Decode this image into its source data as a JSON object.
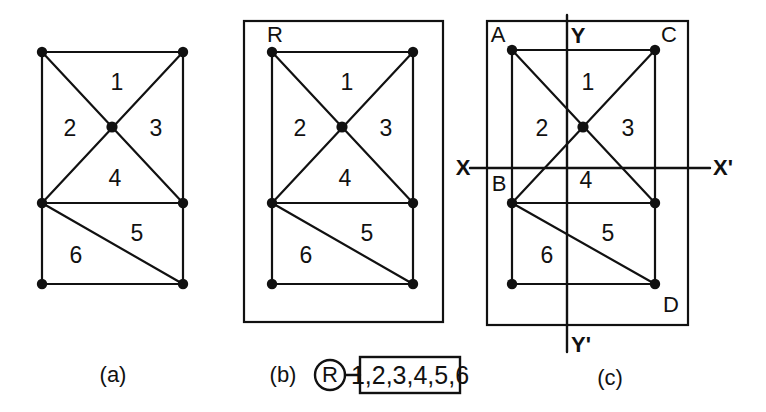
{
  "figure": {
    "kind": "graph-planarity-diagram",
    "panels": [
      {
        "id": "a",
        "caption": "(a)",
        "has_outer_boundary": false,
        "region_labels": [
          "1",
          "2",
          "3",
          "4",
          "5",
          "6"
        ],
        "vertex_labels": []
      },
      {
        "id": "b",
        "caption": "(b)",
        "has_outer_boundary": true,
        "outer_region_label": "R",
        "region_labels": [
          "1",
          "2",
          "3",
          "4",
          "5",
          "6"
        ],
        "vertex_labels": []
      },
      {
        "id": "c",
        "caption": "(c)",
        "has_outer_boundary": true,
        "region_labels": [
          "1",
          "2",
          "3",
          "4",
          "5",
          "6"
        ],
        "vertex_labels": [
          "A",
          "B",
          "C",
          "D"
        ],
        "axes": {
          "horizontal_left": "X",
          "horizontal_right": "X'",
          "vertical_top": "Y",
          "vertical_bottom": "Y'"
        }
      }
    ],
    "region_map": {
      "node_label": "R",
      "box_label": "1,2,3,4,5,6"
    },
    "colors": {
      "stroke": "#111111",
      "text": "#111111",
      "background": "#ffffff"
    }
  },
  "panel_a": {
    "region_1": "1",
    "region_2": "2",
    "region_3": "3",
    "region_4": "4",
    "region_5": "5",
    "region_6": "6",
    "caption": "(a)"
  },
  "panel_b": {
    "outer_label": "R",
    "region_1": "1",
    "region_2": "2",
    "region_3": "3",
    "region_4": "4",
    "region_5": "5",
    "region_6": "6",
    "caption": "(b)",
    "map_node": "R",
    "map_box": "1,2,3,4,5,6"
  },
  "panel_c": {
    "vertex_a": "A",
    "vertex_b": "B",
    "vertex_c": "C",
    "vertex_d": "D",
    "axis_x": "X",
    "axis_x_prime": "X'",
    "axis_y": "Y",
    "axis_y_prime": "Y'",
    "region_1": "1",
    "region_2": "2",
    "region_3": "3",
    "region_4": "4",
    "region_5": "5",
    "region_6": "6",
    "caption": "(c)"
  }
}
